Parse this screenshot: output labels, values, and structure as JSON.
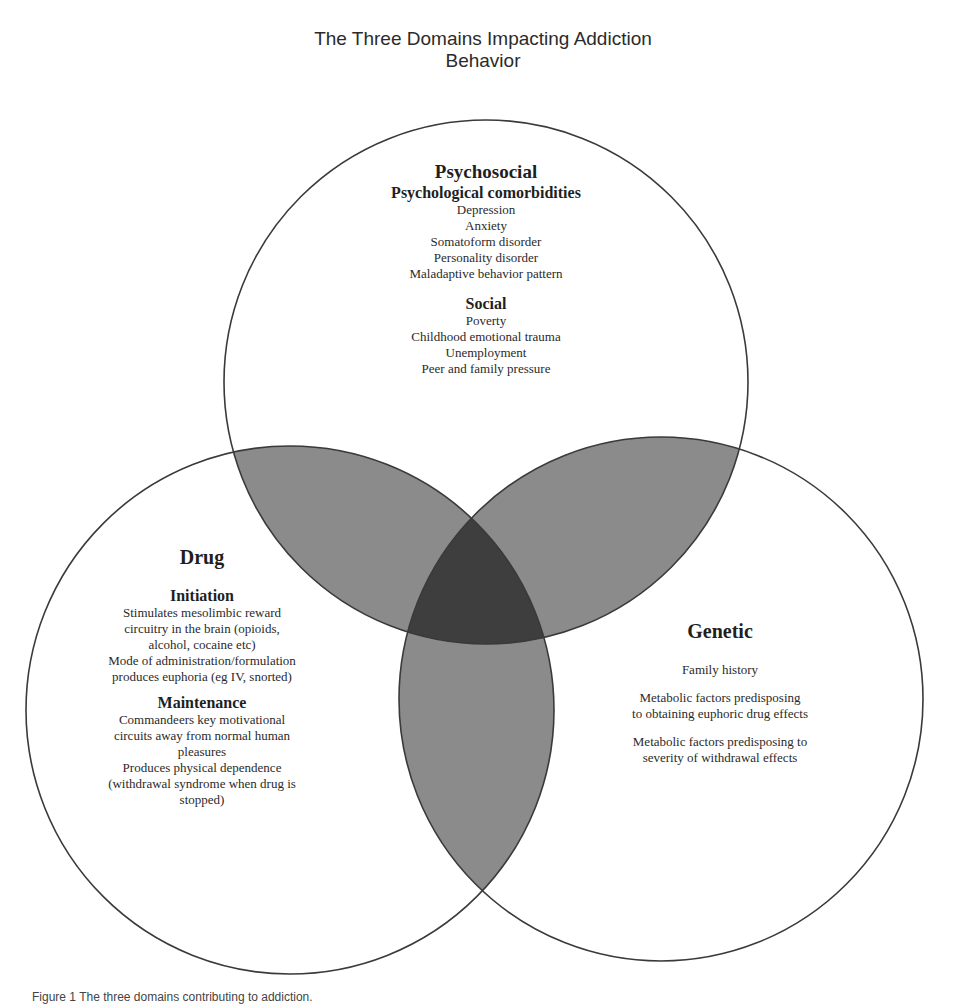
{
  "title": {
    "line1": "The Three Domains Impacting Addiction",
    "line2": "Behavior"
  },
  "colors": {
    "outline": "#3a3a3a",
    "pairwise_overlap": "#8b8b8b",
    "triple_overlap": "#3e3e3e",
    "background": "#ffffff"
  },
  "circles": {
    "psychosocial": {
      "heading": "Psychosocial",
      "sections": [
        {
          "heading": "Psychological comorbidities",
          "items": [
            "Depression",
            "Anxiety",
            "Somatoform disorder",
            "Personality disorder",
            "Maladaptive behavior pattern"
          ]
        },
        {
          "heading": "Social",
          "items": [
            "Poverty",
            "Childhood emotional trauma",
            "Unemployment",
            "Peer and family pressure"
          ]
        }
      ]
    },
    "drug": {
      "heading": "Drug",
      "sections": [
        {
          "heading": "Initiation",
          "items": [
            "Stimulates mesolimbic reward",
            "circuitry in the brain (opioids,",
            "alcohol, cocaine etc)",
            "Mode of administration/formulation",
            "produces euphoria (eg IV, snorted)"
          ]
        },
        {
          "heading": "Maintenance",
          "items": [
            "Commandeers key motivational",
            "circuits away from normal human",
            "pleasures",
            "Produces physical dependence",
            "(withdrawal syndrome when drug is",
            "stopped)"
          ]
        }
      ]
    },
    "genetic": {
      "heading": "Genetic",
      "items": [
        "Family history",
        "Metabolic factors predisposing",
        "to obtaining euphoric drug effects",
        "Metabolic factors predisposing to",
        "severity of withdrawal effects"
      ]
    }
  },
  "caption": "Figure 1 The three domains contributing to addiction."
}
